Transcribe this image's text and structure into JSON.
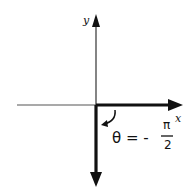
{
  "diagram": {
    "axes": {
      "x_label": "x",
      "y_label": "y"
    },
    "angle": {
      "symbol": "θ =",
      "sign": "-",
      "numerator": "π",
      "denominator": "2",
      "expression": "θ = -π/2"
    },
    "colors": {
      "ink": "#111111",
      "axis_thin": "#555555",
      "background": "#ffffff"
    }
  }
}
